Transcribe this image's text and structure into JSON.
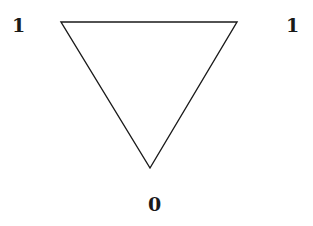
{
  "diagram": {
    "shape": "inverted-triangle",
    "stroke_color": "#1a1a1a",
    "background": "#ffffff",
    "vertices": [
      {
        "id": "top-left",
        "x": 61,
        "y": 22
      },
      {
        "id": "top-right",
        "x": 237,
        "y": 22
      },
      {
        "id": "bottom",
        "x": 150,
        "y": 168
      }
    ],
    "labels": {
      "top_left": "1",
      "top_right": "1",
      "bottom": "0"
    }
  }
}
